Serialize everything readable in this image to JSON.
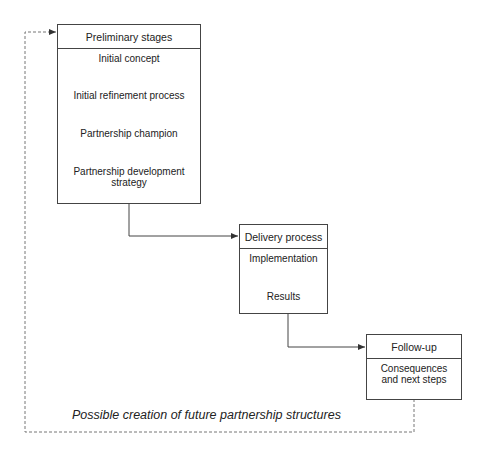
{
  "diagram": {
    "preliminary": {
      "title": "Preliminary stages",
      "steps": [
        "Initial concept",
        "Initial refinement process",
        "Partnership champion",
        "Partnership development",
        "strategy"
      ]
    },
    "delivery": {
      "title": "Delivery process",
      "steps": [
        "Implementation",
        "Results"
      ]
    },
    "followup": {
      "title": "Follow-up",
      "steps": [
        "Consequences",
        "and next steps"
      ]
    },
    "feedback_caption": "Possible creation of future partnership structures",
    "colors": {
      "line": "#444444",
      "dashed": "#777777",
      "text": "#222222"
    }
  }
}
